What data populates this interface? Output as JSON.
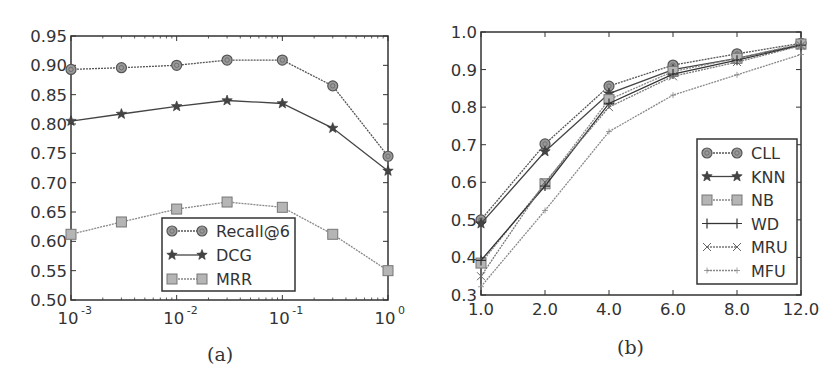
{
  "chart_data": [
    {
      "id": "a",
      "type": "line",
      "caption": "(a)",
      "xscale": "log",
      "x": [
        0.001,
        0.003,
        0.01,
        0.03,
        0.1,
        0.3,
        1.0
      ],
      "xticks": [
        {
          "value": 0.001,
          "base": "10",
          "exp": "-3"
        },
        {
          "value": 0.01,
          "base": "10",
          "exp": "-2"
        },
        {
          "value": 0.1,
          "base": "10",
          "exp": "-1"
        },
        {
          "value": 1.0,
          "base": "10",
          "exp": "0"
        }
      ],
      "yticks": [
        "0.50",
        "0.55",
        "0.60",
        "0.65",
        "0.70",
        "0.75",
        "0.80",
        "0.85",
        "0.90",
        "0.95"
      ],
      "xlim": [
        0.001,
        1.0
      ],
      "ylim": [
        0.5,
        0.95
      ],
      "grid": false,
      "legend_position": "lower center",
      "series": [
        {
          "name": "Recall@6",
          "marker": "circle",
          "color": "#555555",
          "dash": "2,1",
          "values": [
            0.893,
            0.896,
            0.9,
            0.909,
            0.909,
            0.865,
            0.745
          ]
        },
        {
          "name": "DCG",
          "marker": "star",
          "color": "#444444",
          "dash": "",
          "values": [
            0.805,
            0.817,
            0.83,
            0.84,
            0.835,
            0.793,
            0.72
          ]
        },
        {
          "name": "MRR",
          "marker": "square",
          "color": "#888888",
          "dash": "2,1",
          "values": [
            0.612,
            0.633,
            0.655,
            0.667,
            0.658,
            0.612,
            0.55
          ]
        }
      ]
    },
    {
      "id": "b",
      "type": "line",
      "caption": "(b)",
      "xscale": "category",
      "categories": [
        "1.0",
        "2.0",
        "4.0",
        "6.0",
        "8.0",
        "12.0"
      ],
      "yticks": [
        "0.3",
        "0.4",
        "0.5",
        "0.6",
        "0.7",
        "0.8",
        "0.9",
        "1.0"
      ],
      "ylim": [
        0.3,
        1.0
      ],
      "grid": false,
      "legend_position": "lower right",
      "series": [
        {
          "name": "CLL",
          "marker": "circle",
          "color": "#555555",
          "dash": "2,1",
          "values": [
            0.5,
            0.702,
            0.856,
            0.912,
            0.942,
            0.97
          ]
        },
        {
          "name": "KNN",
          "marker": "star",
          "color": "#444444",
          "dash": "",
          "values": [
            0.49,
            0.682,
            0.836,
            0.9,
            0.93,
            0.966
          ]
        },
        {
          "name": "NB",
          "marker": "square",
          "color": "#888888",
          "dash": "2,1",
          "values": [
            0.385,
            0.596,
            0.82,
            0.895,
            0.93,
            0.968
          ]
        },
        {
          "name": "WD",
          "marker": "plus",
          "color": "#333333",
          "dash": "",
          "values": [
            0.392,
            0.59,
            0.81,
            0.888,
            0.925,
            0.965
          ]
        },
        {
          "name": "MRU",
          "marker": "x",
          "color": "#777777",
          "dash": "2,1",
          "values": [
            0.35,
            0.6,
            0.8,
            0.882,
            0.92,
            0.964
          ]
        },
        {
          "name": "MFU",
          "marker": "tri",
          "color": "#888888",
          "dash": "2,1",
          "values": [
            0.322,
            0.525,
            0.735,
            0.832,
            0.886,
            0.94
          ]
        }
      ]
    }
  ]
}
